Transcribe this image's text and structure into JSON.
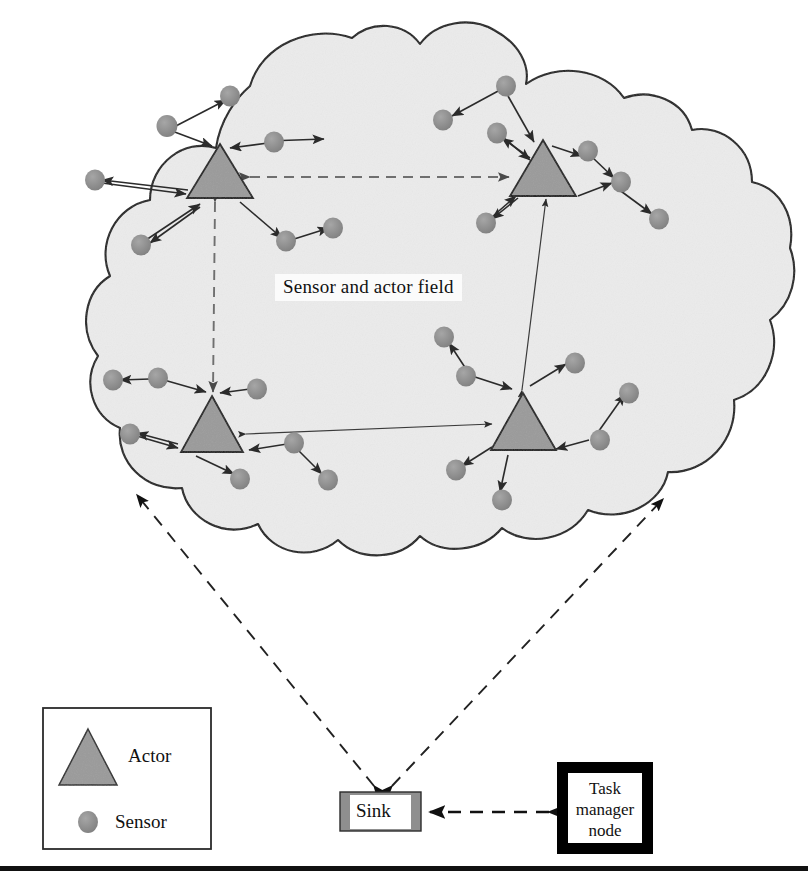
{
  "figure": {
    "field_label": "Sensor and actor field"
  },
  "legend": {
    "items": [
      {
        "label": "Actor",
        "icon": "triangle-icon",
        "color": "#9a9a9a"
      },
      {
        "label": "Sensor",
        "icon": "circle-icon",
        "color": "#8f8f8f"
      }
    ]
  },
  "nodes": {
    "sink": {
      "label": "Sink"
    },
    "task_manager": {
      "label": "Task\nmanager\nnode",
      "line1": "Task",
      "line2": "manager",
      "line3": "node"
    }
  },
  "colors": {
    "cloud_fill": "#ebebeb",
    "cloud_stroke": "#1a1a1a",
    "actor_fill": "#9a9a9a",
    "sensor_fill": "#8f8f8f",
    "link_stroke": "#2b2b2b",
    "dashed_stroke": "#3a3a3a",
    "sink_band": "#8f8f8f",
    "task_border": "#000000",
    "rule": "#111111"
  },
  "diagram_data": {
    "type": "network-diagram",
    "actors": [
      {
        "id": "actor-top-left",
        "apex_x": 220,
        "apex_y": 144,
        "half_w": 33,
        "h": 54
      },
      {
        "id": "actor-top-right",
        "apex_x": 543,
        "apex_y": 140,
        "half_w": 33,
        "h": 56
      },
      {
        "id": "actor-bottom-left",
        "apex_x": 212,
        "apex_y": 396,
        "half_w": 31,
        "h": 56
      },
      {
        "id": "actor-bottom-right",
        "apex_x": 523,
        "apex_y": 393,
        "half_w": 32,
        "h": 57
      }
    ],
    "sensor_counts": {
      "top_left": 7,
      "top_right": 7,
      "bottom_left": 7,
      "bottom_right": 7
    },
    "actor_links": [
      {
        "from": "actor-top-left",
        "to": "actor-top-right",
        "style": "dashed",
        "arrows": "both"
      },
      {
        "from": "actor-top-left",
        "to": "actor-bottom-left",
        "style": "dashed",
        "arrows": "both"
      },
      {
        "from": "actor-bottom-left",
        "to": "actor-bottom-right",
        "style": "solid",
        "arrows": "both"
      },
      {
        "from": "actor-bottom-right",
        "to": "actor-top-right",
        "style": "solid",
        "arrows": "both"
      }
    ],
    "sink_links": [
      {
        "from": "sink",
        "to": "field-left-edge",
        "style": "dashed",
        "arrows": "end"
      },
      {
        "from": "sink",
        "to": "field-right-edge",
        "style": "dashed",
        "arrows": "end"
      },
      {
        "from": "task-manager-node",
        "to": "sink",
        "style": "dashed",
        "arrows": "both"
      }
    ]
  }
}
